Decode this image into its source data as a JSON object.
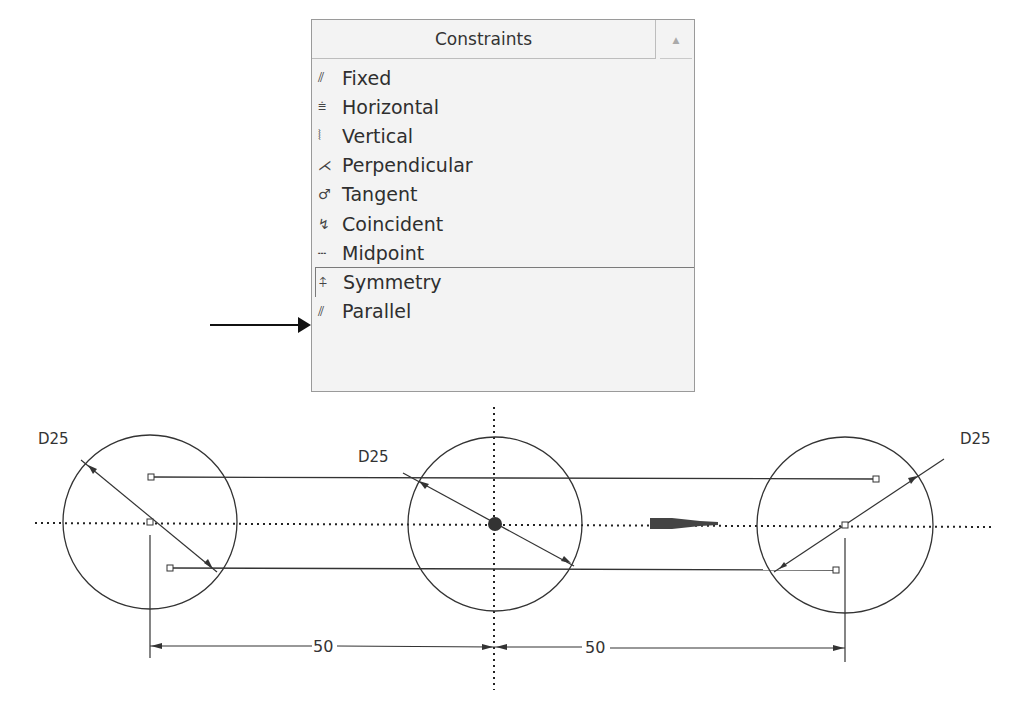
{
  "constraints_panel": {
    "title": "Constraints",
    "collapse_icon": "chevron-up-icon",
    "items": [
      {
        "label": "Fixed",
        "icon": "fixed-icon",
        "glyph": "⫽"
      },
      {
        "label": "Horizontal",
        "icon": "horizontal-icon",
        "glyph": "⩧"
      },
      {
        "label": "Vertical",
        "icon": "vertical-icon",
        "glyph": "⦚"
      },
      {
        "label": "Perpendicular",
        "icon": "perpendicular-icon",
        "glyph": "⋌"
      },
      {
        "label": "Tangent",
        "icon": "tangent-icon",
        "glyph": "♂"
      },
      {
        "label": "Coincident",
        "icon": "coincident-icon",
        "glyph": "↯"
      },
      {
        "label": "Midpoint",
        "icon": "midpoint-icon",
        "glyph": "┄"
      },
      {
        "label": "Symmetry",
        "icon": "symmetry-icon",
        "glyph": "⍏",
        "selected": true
      },
      {
        "label": "Parallel",
        "icon": "parallel-icon",
        "glyph": "⫽"
      }
    ]
  },
  "pointer_arrow": {
    "target": "Symmetry"
  },
  "sketch": {
    "circles": [
      {
        "name": "left",
        "diameter_label": "D25"
      },
      {
        "name": "center",
        "diameter_label": "D25"
      },
      {
        "name": "right",
        "diameter_label": "D25"
      }
    ],
    "dimensions": [
      {
        "name": "left-spacing",
        "value": "50"
      },
      {
        "name": "right-spacing",
        "value": "50"
      }
    ]
  }
}
